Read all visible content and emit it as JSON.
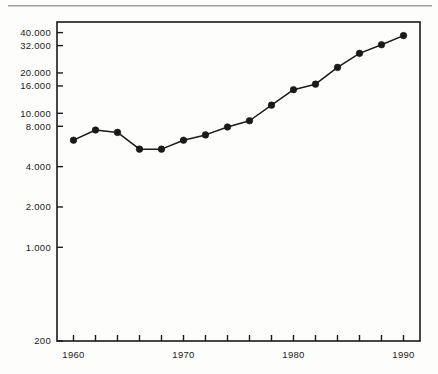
{
  "figure": {
    "background_color": "#fdfdfb",
    "ink_color": "#1a1a1a",
    "top_rule_color": "#8e9096"
  },
  "chart_data": {
    "type": "line",
    "title": "",
    "subtitle": "",
    "xlabel": "",
    "ylabel": "",
    "yscale": "log",
    "xscale": "linear",
    "grid": false,
    "legend": null,
    "xlim": [
      1958.5,
      1991.5
    ],
    "ylim": [
      200,
      48000
    ],
    "x_tick_values": [
      1960,
      1962,
      1964,
      1966,
      1968,
      1970,
      1972,
      1974,
      1976,
      1978,
      1980,
      1982,
      1984,
      1986,
      1988,
      1990
    ],
    "x_tick_labels": [
      "1960",
      "",
      "",
      "",
      "",
      "1970",
      "",
      "",
      "",
      "",
      "1980",
      "",
      "",
      "",
      "",
      "1990"
    ],
    "x_labeled_ticks": [
      {
        "value": 1960,
        "label": "1960"
      },
      {
        "value": 1970,
        "label": "1970"
      },
      {
        "value": 1980,
        "label": "1980"
      },
      {
        "value": 1990,
        "label": "1990"
      }
    ],
    "y_ticks": [
      {
        "value": 200,
        "label": "200"
      },
      {
        "value": 1000,
        "label": "1.000"
      },
      {
        "value": 2000,
        "label": "2.000"
      },
      {
        "value": 4000,
        "label": "4.000"
      },
      {
        "value": 8000,
        "label": "8.000"
      },
      {
        "value": 10000,
        "label": "10.000"
      },
      {
        "value": 16000,
        "label": "16.000"
      },
      {
        "value": 20000,
        "label": "20.000"
      },
      {
        "value": 32000,
        "label": "32.000"
      },
      {
        "value": 40000,
        "label": "40.000"
      }
    ],
    "x": [
      1960,
      1962,
      1964,
      1966,
      1968,
      1970,
      1972,
      1974,
      1976,
      1978,
      1980,
      1982,
      1984,
      1986,
      1988,
      1990
    ],
    "values": [
      6300,
      7500,
      7200,
      5400,
      5400,
      6300,
      6900,
      7900,
      8800,
      11500,
      15000,
      16500,
      22000,
      28000,
      32500,
      38000
    ],
    "series": [
      {
        "name": "",
        "marker": "filled-circle",
        "line_color": "#1a1a1a",
        "marker_color": "#1a1a1a",
        "points": [
          {
            "x": 1960,
            "y": 6300
          },
          {
            "x": 1962,
            "y": 7500
          },
          {
            "x": 1964,
            "y": 7200
          },
          {
            "x": 1966,
            "y": 5400
          },
          {
            "x": 1968,
            "y": 5400
          },
          {
            "x": 1970,
            "y": 6300
          },
          {
            "x": 1972,
            "y": 6900
          },
          {
            "x": 1974,
            "y": 7900
          },
          {
            "x": 1976,
            "y": 8800
          },
          {
            "x": 1978,
            "y": 11500
          },
          {
            "x": 1980,
            "y": 15000
          },
          {
            "x": 1982,
            "y": 16500
          },
          {
            "x": 1984,
            "y": 22000
          },
          {
            "x": 1986,
            "y": 28000
          },
          {
            "x": 1988,
            "y": 32500
          },
          {
            "x": 1990,
            "y": 38000
          }
        ]
      }
    ]
  }
}
